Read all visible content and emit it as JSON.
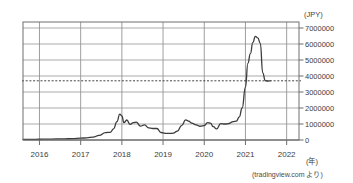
{
  "chart_data": {
    "type": "line",
    "title": "",
    "subtitle": "",
    "xlabel": "(年)",
    "ylabel": "(JPY)",
    "unit_y": "(JPY)",
    "unit_x": "(年)",
    "source": "(tradingview.com より)",
    "grid": true,
    "legend": "none",
    "xlim": [
      2015.6,
      2022.3
    ],
    "ylim": [
      -300000,
      7400000
    ],
    "xticks": [
      2016,
      2017,
      2018,
      2019,
      2020,
      2021,
      2022
    ],
    "xtick_labels": [
      "2016",
      "2017",
      "2018",
      "2019",
      "2020",
      "2021",
      "2022"
    ],
    "yticks": [
      0,
      1000000,
      2000000,
      3000000,
      4000000,
      5000000,
      6000000,
      7000000
    ],
    "ytick_labels": [
      "0",
      "1000000",
      "2000000",
      "3000000",
      "4000000",
      "5000000",
      "6000000",
      "7000000"
    ],
    "reference_line": {
      "value": 3700000,
      "style": "dashed",
      "label": ""
    },
    "series": [
      {
        "name": "Bitcoin price (JPY)",
        "color": "#3c3c3c",
        "x": [
          2015.6,
          2015.8,
          2016.0,
          2016.2,
          2016.4,
          2016.6,
          2016.8,
          2017.0,
          2017.15,
          2017.3,
          2017.45,
          2017.6,
          2017.72,
          2017.8,
          2017.88,
          2017.95,
          2018.0,
          2018.05,
          2018.12,
          2018.2,
          2018.28,
          2018.35,
          2018.45,
          2018.55,
          2018.65,
          2018.75,
          2018.85,
          2018.95,
          2019.05,
          2019.15,
          2019.25,
          2019.35,
          2019.45,
          2019.55,
          2019.62,
          2019.7,
          2019.8,
          2019.9,
          2020.0,
          2020.08,
          2020.15,
          2020.22,
          2020.3,
          2020.4,
          2020.5,
          2020.6,
          2020.7,
          2020.78,
          2020.85,
          2020.92,
          2021.0,
          2021.06,
          2021.12,
          2021.18,
          2021.24,
          2021.3,
          2021.36,
          2021.42,
          2021.48,
          2021.54,
          2021.6
        ],
        "y": [
          35000,
          40000,
          48000,
          55000,
          65000,
          72000,
          85000,
          115000,
          135000,
          180000,
          290000,
          460000,
          480000,
          700000,
          1150000,
          1620000,
          1500000,
          1080000,
          1250000,
          980000,
          1080000,
          1120000,
          870000,
          950000,
          760000,
          720000,
          720000,
          470000,
          420000,
          410000,
          430000,
          560000,
          900000,
          1260000,
          1180000,
          1060000,
          950000,
          860000,
          900000,
          1080000,
          1050000,
          830000,
          690000,
          1020000,
          1000000,
          1030000,
          1150000,
          1180000,
          1450000,
          2000000,
          3300000,
          4800000,
          5400000,
          6100000,
          6480000,
          6380000,
          6050000,
          4200000,
          3720000,
          3680000,
          3700000
        ]
      }
    ],
    "peak": {
      "x": 2021.24,
      "y": 6480000
    }
  }
}
